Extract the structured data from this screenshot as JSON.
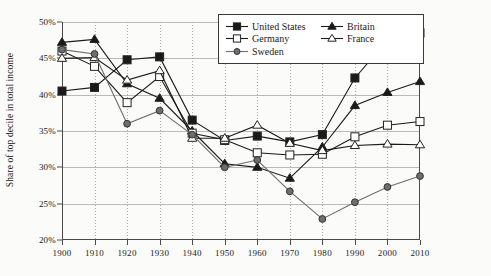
{
  "axes": {
    "ylabel": "Share of top decile in total income",
    "yticks": [
      "20%",
      "25%",
      "30%",
      "35%",
      "40%",
      "45%",
      "50%"
    ],
    "xticks": [
      "1900",
      "1910",
      "1920",
      "1930",
      "1940",
      "1950",
      "1960",
      "1970",
      "1980",
      "1990",
      "2000",
      "2010"
    ]
  },
  "legend": {
    "entries": [
      {
        "label": "United States",
        "marker": "filled-square",
        "color": "#1a1a1a"
      },
      {
        "label": "Britain",
        "marker": "filled-triangle",
        "color": "#1a1a1a"
      },
      {
        "label": "Germany",
        "marker": "open-square",
        "color": "#1a1a1a"
      },
      {
        "label": "France",
        "marker": "open-triangle",
        "color": "#1a1a1a"
      },
      {
        "label": "Sweden",
        "marker": "filled-circle",
        "color": "#6e6e6e"
      }
    ]
  },
  "chart_data": {
    "type": "line",
    "title": "",
    "xlabel": "",
    "ylabel": "Share of top decile in total income",
    "x": [
      1900,
      1910,
      1920,
      1930,
      1940,
      1950,
      1960,
      1970,
      1980,
      1990,
      2000,
      2010
    ],
    "xlim": [
      1900,
      2010
    ],
    "ylim": [
      20,
      50
    ],
    "ytick_step": 5,
    "grid": "horizontal-solid-and-vertical-dotted",
    "legend_position": "top-right-inside",
    "series": [
      {
        "name": "United States",
        "marker": "filled-square",
        "values": [
          40.5,
          41.0,
          44.8,
          45.2,
          36.5,
          33.7,
          34.3,
          33.5,
          34.5,
          42.3,
          47.5,
          48.5
        ]
      },
      {
        "name": "Britain",
        "marker": "filled-triangle",
        "values": [
          47.2,
          47.6,
          41.5,
          39.5,
          35.0,
          30.5,
          30.0,
          28.5,
          32.8,
          38.5,
          40.3,
          41.8
        ]
      },
      {
        "name": "Germany",
        "marker": "open-square",
        "values": [
          46.0,
          43.9,
          38.9,
          42.5,
          34.7,
          33.8,
          32.0,
          31.7,
          31.8,
          34.2,
          35.8,
          36.3
        ]
      },
      {
        "name": "France",
        "marker": "open-triangle",
        "values": [
          45.0,
          45.1,
          42.0,
          43.3,
          34.0,
          34.0,
          35.8,
          33.3,
          32.3,
          33.0,
          33.2,
          33.1
        ]
      },
      {
        "name": "Sweden",
        "marker": "filled-circle",
        "values": [
          46.2,
          45.6,
          36.0,
          37.8,
          34.5,
          30.0,
          31.0,
          26.7,
          22.9,
          25.2,
          27.3,
          28.8
        ]
      }
    ]
  }
}
